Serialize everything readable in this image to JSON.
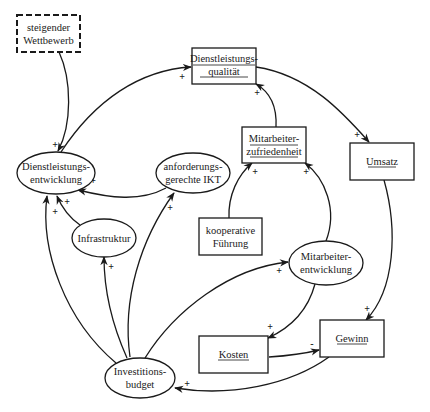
{
  "diagram": {
    "type": "causal-loop-diagram",
    "nodes": {
      "wettbewerb": {
        "line1": "steigender",
        "line2": "Wettbewerb",
        "shape": "dashed-box"
      },
      "dl_qualitaet": {
        "line1": "Dienstleistungs-",
        "line2": "qualität",
        "shape": "box",
        "underlined": true
      },
      "dl_entwicklung": {
        "line1": "Dienstleistungs-",
        "line2": "entwicklung",
        "shape": "ellipse"
      },
      "ikt": {
        "line1": "anforderungs-",
        "line2": "gerechte IKT",
        "shape": "ellipse"
      },
      "ma_zufriedenheit": {
        "line1": "Mitarbeiter-",
        "line2": "zufriedenheit",
        "shape": "box",
        "underlined": true
      },
      "umsatz": {
        "line1": "Umsatz",
        "shape": "box",
        "underlined": true
      },
      "infrastruktur": {
        "line1": "Infrastruktur",
        "shape": "ellipse"
      },
      "fuehrung": {
        "line1": "kooperative",
        "line2": "Führung",
        "shape": "box"
      },
      "ma_entwicklung": {
        "line1": "Mitarbeiter-",
        "line2": "entwicklung",
        "shape": "ellipse"
      },
      "kosten": {
        "line1": "Kosten",
        "shape": "box",
        "underlined": true
      },
      "gewinn": {
        "line1": "Gewinn",
        "shape": "box",
        "underlined": true
      },
      "budget": {
        "line1": "Investitions-",
        "line2": "budget",
        "shape": "ellipse"
      }
    },
    "edges": [
      {
        "from": "steigender Wettbewerb",
        "to": "Dienstleistungsentwicklung",
        "sign": "+"
      },
      {
        "from": "Dienstleistungsentwicklung",
        "to": "Dienstleistungsqualität",
        "sign": "+"
      },
      {
        "from": "Dienstleistungsqualität",
        "to": "Umsatz",
        "sign": "+"
      },
      {
        "from": "Mitarbeiterzufriedenheit",
        "to": "Dienstleistungsqualität",
        "sign": "+"
      },
      {
        "from": "anforderungsgerechte IKT",
        "to": "Dienstleistungsentwicklung",
        "sign": "+"
      },
      {
        "from": "Infrastruktur",
        "to": "Dienstleistungsentwicklung",
        "sign": "+"
      },
      {
        "from": "Investitionsbudget",
        "to": "Dienstleistungsentwicklung",
        "sign": "+"
      },
      {
        "from": "Investitionsbudget",
        "to": "Infrastruktur",
        "sign": "+"
      },
      {
        "from": "Investitionsbudget",
        "to": "anforderungsgerechte IKT",
        "sign": "+"
      },
      {
        "from": "Investitionsbudget",
        "to": "Mitarbeiterentwicklung",
        "sign": "+"
      },
      {
        "from": "kooperative Führung",
        "to": "Mitarbeiterzufriedenheit",
        "sign": "+"
      },
      {
        "from": "Mitarbeiterentwicklung",
        "to": "Mitarbeiterzufriedenheit",
        "sign": "+"
      },
      {
        "from": "Mitarbeiterentwicklung",
        "to": "Kosten",
        "sign": "+"
      },
      {
        "from": "Umsatz",
        "to": "Gewinn",
        "sign": "+"
      },
      {
        "from": "Kosten",
        "to": "Gewinn",
        "sign": "-"
      },
      {
        "from": "Gewinn",
        "to": "Investitionsbudget",
        "sign": "+"
      }
    ],
    "signs": {
      "plus": "+",
      "minus": "-"
    }
  }
}
